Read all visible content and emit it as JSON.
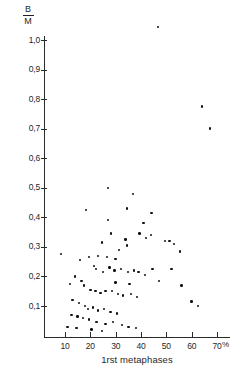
{
  "chart_data": {
    "type": "scatter",
    "title": "",
    "subtitle": "",
    "xlabel": "1rst metaphases",
    "ylabel": "B/M",
    "ylabel_numerator": "B",
    "ylabel_denominator": "M",
    "x_unit": "%",
    "xlim": [
      0,
      75
    ],
    "ylim": [
      0,
      1.1
    ],
    "grid": false,
    "legend": null,
    "x_ticks": [
      10,
      20,
      30,
      40,
      50,
      60,
      70
    ],
    "x_tick_labels": [
      "10",
      "20",
      "30",
      "40",
      "50",
      "60",
      "70"
    ],
    "y_ticks": [
      0.1,
      0.2,
      0.3,
      0.4,
      0.5,
      0.6,
      0.7,
      0.8,
      0.9,
      1.0
    ],
    "y_tick_labels": [
      "0,1",
      "0,2",
      "0,3",
      "0,4",
      "0,5",
      "0,6",
      "0,7",
      "0,8",
      "0,9",
      "1,0"
    ],
    "marker": "filled-circle",
    "marker_color": "#111111",
    "points": [
      [
        8.5,
        0.275
      ],
      [
        46.8,
        1.045
      ],
      [
        64.0,
        0.775
      ],
      [
        67.2,
        0.7
      ],
      [
        18.3,
        0.425
      ],
      [
        27.0,
        0.5
      ],
      [
        36.9,
        0.48
      ],
      [
        34.5,
        0.43
      ],
      [
        44.2,
        0.415
      ],
      [
        41.0,
        0.38
      ],
      [
        27.0,
        0.39
      ],
      [
        28.2,
        0.345
      ],
      [
        24.5,
        0.315
      ],
      [
        33.9,
        0.325
      ],
      [
        34.5,
        0.305
      ],
      [
        39.4,
        0.345
      ],
      [
        42.0,
        0.33
      ],
      [
        44.0,
        0.34
      ],
      [
        49.5,
        0.32
      ],
      [
        51.2,
        0.32
      ],
      [
        53.0,
        0.31
      ],
      [
        55.5,
        0.285
      ],
      [
        31.2,
        0.29
      ],
      [
        30.0,
        0.26
      ],
      [
        26.5,
        0.265
      ],
      [
        23.0,
        0.27
      ],
      [
        19.5,
        0.265
      ],
      [
        16.0,
        0.255
      ],
      [
        21.5,
        0.235
      ],
      [
        22.2,
        0.225
      ],
      [
        25.0,
        0.215
      ],
      [
        27.6,
        0.23
      ],
      [
        29.5,
        0.22
      ],
      [
        32.0,
        0.225
      ],
      [
        34.8,
        0.215
      ],
      [
        37.2,
        0.22
      ],
      [
        39.0,
        0.215
      ],
      [
        41.5,
        0.205
      ],
      [
        44.6,
        0.225
      ],
      [
        47.0,
        0.185
      ],
      [
        52.0,
        0.225
      ],
      [
        56.0,
        0.17
      ],
      [
        60.0,
        0.115
      ],
      [
        62.5,
        0.1
      ],
      [
        14.0,
        0.2
      ],
      [
        12.0,
        0.175
      ],
      [
        17.5,
        0.17
      ],
      [
        20.0,
        0.155
      ],
      [
        22.0,
        0.15
      ],
      [
        24.0,
        0.145
      ],
      [
        26.0,
        0.15
      ],
      [
        28.5,
        0.15
      ],
      [
        31.0,
        0.14
      ],
      [
        33.0,
        0.135
      ],
      [
        36.0,
        0.14
      ],
      [
        38.5,
        0.13
      ],
      [
        13.0,
        0.12
      ],
      [
        15.5,
        0.11
      ],
      [
        18.0,
        0.1
      ],
      [
        19.0,
        0.09
      ],
      [
        21.0,
        0.095
      ],
      [
        23.0,
        0.085
      ],
      [
        25.5,
        0.09
      ],
      [
        28.0,
        0.08
      ],
      [
        30.5,
        0.075
      ],
      [
        12.5,
        0.07
      ],
      [
        15.0,
        0.065
      ],
      [
        17.0,
        0.06
      ],
      [
        19.5,
        0.055
      ],
      [
        22.5,
        0.045
      ],
      [
        26.0,
        0.04
      ],
      [
        29.0,
        0.045
      ],
      [
        32.5,
        0.035
      ],
      [
        35.0,
        0.03
      ],
      [
        38.0,
        0.025
      ],
      [
        11.0,
        0.03
      ],
      [
        14.5,
        0.025
      ],
      [
        20.5,
        0.02
      ],
      [
        24.5,
        0.015
      ],
      [
        16.5,
        0.185
      ],
      [
        30.0,
        0.18
      ],
      [
        35.5,
        0.175
      ]
    ]
  }
}
